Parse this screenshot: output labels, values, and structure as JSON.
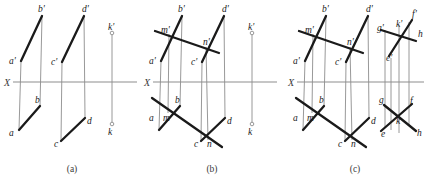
{
  "figure": {
    "background_color": "#ffffff",
    "thick_line_color": "#1a1a1a",
    "thin_line_color": "#8d8d8d",
    "width": 427,
    "height": 179
  },
  "captions": [
    {
      "text": "(a)",
      "x": 72,
      "y": 172
    },
    {
      "text": "(b)",
      "x": 212,
      "y": 172
    },
    {
      "text": "(c)",
      "x": 355,
      "y": 172
    }
  ],
  "panels": [
    {
      "id": "panel-a",
      "caption": "(a)",
      "axis": {
        "label": "X",
        "label_x": 4,
        "label_y": 86,
        "x1": 13,
        "y1": 82,
        "x2": 137,
        "y2": 82
      },
      "thick_segments": [
        {
          "name": "ab-prime",
          "x1": 21,
          "y1": 61,
          "x2": 42,
          "y2": 16
        },
        {
          "name": "ab",
          "x1": 19,
          "y1": 130,
          "x2": 40,
          "y2": 106
        },
        {
          "name": "cd-prime",
          "x1": 62,
          "y1": 62,
          "x2": 84,
          "y2": 16
        },
        {
          "name": "cd",
          "x1": 61,
          "y1": 141,
          "x2": 85,
          "y2": 118
        }
      ],
      "thin_segments": [
        {
          "name": "connector-a",
          "x1": 21,
          "y1": 61,
          "x2": 19,
          "y2": 130
        },
        {
          "name": "connector-b",
          "x1": 42,
          "y1": 16,
          "x2": 40,
          "y2": 106
        },
        {
          "name": "connector-c",
          "x1": 62,
          "y1": 62,
          "x2": 61,
          "y2": 141
        },
        {
          "name": "connector-d",
          "x1": 84,
          "y1": 16,
          "x2": 85,
          "y2": 118
        },
        {
          "name": "connector-k",
          "x1": 112,
          "y1": 33,
          "x2": 112,
          "y2": 124
        }
      ],
      "point_markers": [
        {
          "name": "k-prime-marker",
          "cx": 112,
          "cy": 33,
          "r": 1.8
        },
        {
          "name": "k-marker",
          "cx": 112,
          "cy": 124,
          "r": 1.8
        }
      ],
      "labels": [
        {
          "name": "b-prime",
          "text": "b'",
          "x": 38,
          "y": 12
        },
        {
          "name": "d-prime",
          "text": "d'",
          "x": 82,
          "y": 12
        },
        {
          "name": "k-prime",
          "text": "k'",
          "x": 108,
          "y": 30
        },
        {
          "name": "a-prime",
          "text": "a'",
          "x": 9,
          "y": 64
        },
        {
          "name": "c-prime",
          "text": "c'",
          "x": 51,
          "y": 65
        },
        {
          "name": "b",
          "text": "b",
          "x": 35,
          "y": 103
        },
        {
          "name": "a",
          "text": "a",
          "x": 9,
          "y": 136
        },
        {
          "name": "d",
          "text": "d",
          "x": 87,
          "y": 124
        },
        {
          "name": "c",
          "text": "c",
          "x": 54,
          "y": 147
        },
        {
          "name": "k",
          "text": "k",
          "x": 108,
          "y": 135
        }
      ]
    },
    {
      "id": "panel-b",
      "caption": "(b)",
      "axis": {
        "label": "X",
        "label_x": 144,
        "label_y": 86,
        "x1": 153,
        "y1": 82,
        "x2": 277,
        "y2": 82
      },
      "thick_segments": [
        {
          "name": "ab-prime",
          "x1": 161,
          "y1": 61,
          "x2": 182,
          "y2": 16
        },
        {
          "name": "ab",
          "x1": 159,
          "y1": 130,
          "x2": 180,
          "y2": 106
        },
        {
          "name": "cd-prime",
          "x1": 202,
          "y1": 62,
          "x2": 224,
          "y2": 16
        },
        {
          "name": "cd",
          "x1": 201,
          "y1": 141,
          "x2": 225,
          "y2": 118
        },
        {
          "name": "mn-prime",
          "x1": 155,
          "y1": 31,
          "x2": 219,
          "y2": 53
        },
        {
          "name": "mn",
          "x1": 152,
          "y1": 98,
          "x2": 222,
          "y2": 147
        }
      ],
      "thin_segments": [
        {
          "name": "connector-a",
          "x1": 161,
          "y1": 61,
          "x2": 159,
          "y2": 130
        },
        {
          "name": "connector-b",
          "x1": 182,
          "y1": 16,
          "x2": 180,
          "y2": 106
        },
        {
          "name": "connector-c",
          "x1": 202,
          "y1": 62,
          "x2": 201,
          "y2": 141
        },
        {
          "name": "connector-d",
          "x1": 224,
          "y1": 16,
          "x2": 225,
          "y2": 118
        },
        {
          "name": "connector-m",
          "x1": 169,
          "y1": 34,
          "x2": 168,
          "y2": 113
        },
        {
          "name": "connector-n",
          "x1": 206,
          "y1": 47,
          "x2": 208,
          "y2": 140
        },
        {
          "name": "connector-k",
          "x1": 252,
          "y1": 33,
          "x2": 252,
          "y2": 124
        }
      ],
      "point_markers": [
        {
          "name": "k-prime-marker",
          "cx": 252,
          "cy": 33,
          "r": 1.8
        },
        {
          "name": "k-marker",
          "cx": 252,
          "cy": 124,
          "r": 1.8
        }
      ],
      "labels": [
        {
          "name": "b-prime",
          "text": "b'",
          "x": 178,
          "y": 12
        },
        {
          "name": "d-prime",
          "text": "d'",
          "x": 222,
          "y": 12
        },
        {
          "name": "k-prime",
          "text": "k'",
          "x": 248,
          "y": 30
        },
        {
          "name": "m-prime",
          "text": "m'",
          "x": 161,
          "y": 33
        },
        {
          "name": "n-prime",
          "text": "n'",
          "x": 203,
          "y": 45
        },
        {
          "name": "a-prime",
          "text": "a'",
          "x": 149,
          "y": 64
        },
        {
          "name": "c-prime",
          "text": "c'",
          "x": 191,
          "y": 65
        },
        {
          "name": "b",
          "text": "b",
          "x": 175,
          "y": 103
        },
        {
          "name": "a",
          "text": "a",
          "x": 149,
          "y": 121
        },
        {
          "name": "m",
          "text": "m",
          "x": 163,
          "y": 121
        },
        {
          "name": "d",
          "text": "d",
          "x": 227,
          "y": 124
        },
        {
          "name": "c",
          "text": "c",
          "x": 194,
          "y": 147
        },
        {
          "name": "n",
          "text": "n",
          "x": 207,
          "y": 147
        },
        {
          "name": "k",
          "text": "k",
          "x": 248,
          "y": 135
        }
      ]
    },
    {
      "id": "panel-c",
      "caption": "(c)",
      "axis": {
        "label": "X",
        "label_x": 288,
        "label_y": 86,
        "x1": 297,
        "y1": 82,
        "x2": 424,
        "y2": 82
      },
      "thick_segments": [
        {
          "name": "ab-prime",
          "x1": 305,
          "y1": 61,
          "x2": 326,
          "y2": 16
        },
        {
          "name": "ab",
          "x1": 303,
          "y1": 130,
          "x2": 324,
          "y2": 106
        },
        {
          "name": "cd-prime",
          "x1": 346,
          "y1": 62,
          "x2": 368,
          "y2": 16
        },
        {
          "name": "cd",
          "x1": 345,
          "y1": 141,
          "x2": 369,
          "y2": 118
        },
        {
          "name": "mn-prime",
          "x1": 299,
          "y1": 31,
          "x2": 363,
          "y2": 53
        },
        {
          "name": "mn",
          "x1": 296,
          "y1": 98,
          "x2": 366,
          "y2": 147
        },
        {
          "name": "eg-prime",
          "x1": 389,
          "y1": 56,
          "x2": 412,
          "y2": 20
        },
        {
          "name": "fh-prime",
          "x1": 381,
          "y1": 30,
          "x2": 416,
          "y2": 41
        },
        {
          "name": "eg",
          "x1": 381,
          "y1": 131,
          "x2": 412,
          "y2": 104
        },
        {
          "name": "fh",
          "x1": 384,
          "y1": 105,
          "x2": 416,
          "y2": 131
        }
      ],
      "thin_segments": [
        {
          "name": "connector-a",
          "x1": 305,
          "y1": 61,
          "x2": 303,
          "y2": 130
        },
        {
          "name": "connector-b",
          "x1": 326,
          "y1": 16,
          "x2": 324,
          "y2": 106
        },
        {
          "name": "connector-c",
          "x1": 346,
          "y1": 62,
          "x2": 345,
          "y2": 141
        },
        {
          "name": "connector-d",
          "x1": 368,
          "y1": 16,
          "x2": 369,
          "y2": 118
        },
        {
          "name": "connector-m",
          "x1": 313,
          "y1": 34,
          "x2": 312,
          "y2": 113
        },
        {
          "name": "connector-n",
          "x1": 350,
          "y1": 47,
          "x2": 352,
          "y2": 140
        },
        {
          "name": "connector-g",
          "x1": 385,
          "y1": 30,
          "x2": 385,
          "y2": 127
        },
        {
          "name": "connector-k",
          "x1": 399,
          "y1": 25,
          "x2": 399,
          "y2": 133
        },
        {
          "name": "connector-e",
          "x1": 391,
          "y1": 58,
          "x2": 391,
          "y2": 130
        },
        {
          "name": "connector-f",
          "x1": 409,
          "y1": 22,
          "x2": 409,
          "y2": 125
        }
      ],
      "point_markers": [],
      "labels": [
        {
          "name": "b-prime",
          "text": "b'",
          "x": 322,
          "y": 12
        },
        {
          "name": "d-prime",
          "text": "d'",
          "x": 366,
          "y": 12
        },
        {
          "name": "f-prime",
          "text": "f'",
          "x": 412,
          "y": 17
        },
        {
          "name": "m-prime",
          "text": "m'",
          "x": 305,
          "y": 33
        },
        {
          "name": "g-prime",
          "text": "g'",
          "x": 377,
          "y": 31
        },
        {
          "name": "k-prime",
          "text": "k'",
          "x": 396,
          "y": 27
        },
        {
          "name": "h",
          "text": "h",
          "x": 418,
          "y": 37
        },
        {
          "name": "n-prime",
          "text": "n'",
          "x": 347,
          "y": 45
        },
        {
          "name": "a-prime",
          "text": "a'",
          "x": 293,
          "y": 64
        },
        {
          "name": "c-prime",
          "text": "c'",
          "x": 335,
          "y": 65
        },
        {
          "name": "e-prime",
          "text": "e'",
          "x": 386,
          "y": 61
        },
        {
          "name": "b",
          "text": "b",
          "x": 319,
          "y": 103
        },
        {
          "name": "g",
          "text": "g",
          "x": 379,
          "y": 103
        },
        {
          "name": "f",
          "text": "f",
          "x": 410,
          "y": 104
        },
        {
          "name": "a",
          "text": "a",
          "x": 293,
          "y": 121
        },
        {
          "name": "m",
          "text": "m",
          "x": 307,
          "y": 121
        },
        {
          "name": "d",
          "text": "d",
          "x": 371,
          "y": 124
        },
        {
          "name": "k",
          "text": "k",
          "x": 396,
          "y": 124
        },
        {
          "name": "e",
          "text": "e",
          "x": 381,
          "y": 137
        },
        {
          "name": "h",
          "text": "h",
          "x": 417,
          "y": 136
        },
        {
          "name": "c",
          "text": "c",
          "x": 338,
          "y": 147
        },
        {
          "name": "n",
          "text": "n",
          "x": 351,
          "y": 147
        }
      ]
    }
  ]
}
